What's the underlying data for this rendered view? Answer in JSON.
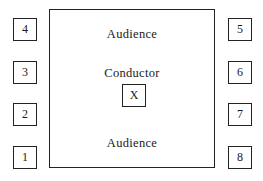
{
  "diagram": {
    "stage": {
      "top_label": "Audience",
      "middle_label": "Conductor",
      "conductor_marker": "X",
      "bottom_label": "Audience"
    },
    "left_positions": [
      "4",
      "3",
      "2",
      "1"
    ],
    "right_positions": [
      "5",
      "6",
      "7",
      "8"
    ],
    "colors": {
      "stroke": "#222222",
      "text": "#1a1a1a",
      "background": "#ffffff"
    }
  }
}
